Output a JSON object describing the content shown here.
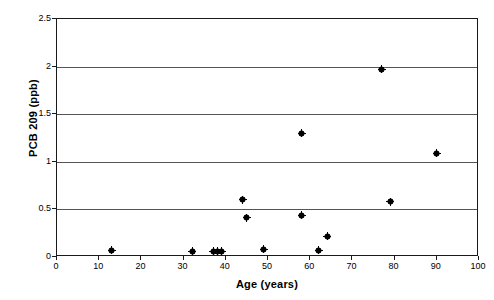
{
  "chart_data": {
    "type": "scatter",
    "title": "",
    "xlabel": "Age (years)",
    "ylabel": "PCB 209 (ppb)",
    "xlim": [
      0,
      100
    ],
    "ylim": [
      0,
      2.5
    ],
    "xticks": [
      "0",
      "10",
      "20",
      "30",
      "40",
      "50",
      "60",
      "70",
      "80",
      "90",
      "100"
    ],
    "xtick_values": [
      0,
      10,
      20,
      30,
      40,
      50,
      60,
      70,
      80,
      90,
      100
    ],
    "yticks": [
      "0",
      "0.5",
      "1",
      "1.5",
      "2",
      "2.5"
    ],
    "ytick_values": [
      0,
      0.5,
      1,
      1.5,
      2,
      2.5
    ],
    "grid": "horizontal",
    "legend": "none",
    "marker": "diamond-dot",
    "marker_color": "#000000",
    "points": [
      {
        "x": 13,
        "y": 0.07
      },
      {
        "x": 32,
        "y": 0.06
      },
      {
        "x": 37,
        "y": 0.06
      },
      {
        "x": 38,
        "y": 0.06
      },
      {
        "x": 39,
        "y": 0.06
      },
      {
        "x": 44,
        "y": 0.6
      },
      {
        "x": 45,
        "y": 0.41
      },
      {
        "x": 49,
        "y": 0.08
      },
      {
        "x": 58,
        "y": 1.3
      },
      {
        "x": 58,
        "y": 0.44
      },
      {
        "x": 62,
        "y": 0.07
      },
      {
        "x": 64,
        "y": 0.22
      },
      {
        "x": 77,
        "y": 1.97
      },
      {
        "x": 79,
        "y": 0.58
      },
      {
        "x": 90,
        "y": 1.09
      }
    ]
  }
}
